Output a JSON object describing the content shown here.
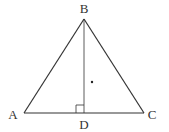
{
  "diagram": {
    "type": "geometry",
    "stroke_color": "#333333",
    "points": {
      "A": {
        "label": "A",
        "x": 24,
        "y": 113,
        "label_x": 13,
        "label_y": 119
      },
      "B": {
        "label": "B",
        "x": 84,
        "y": 19,
        "label_x": 84,
        "label_y": 13
      },
      "C": {
        "label": "C",
        "x": 144,
        "y": 113,
        "label_x": 152,
        "label_y": 119
      },
      "D": {
        "label": "D",
        "x": 84,
        "y": 113,
        "label_x": 84,
        "label_y": 129
      }
    },
    "segments": [
      "AB",
      "BC",
      "CA",
      "BD"
    ],
    "right_angle_marker": {
      "at": "D",
      "size": 8
    },
    "marked_point": {
      "x": 92,
      "y": 82
    }
  }
}
